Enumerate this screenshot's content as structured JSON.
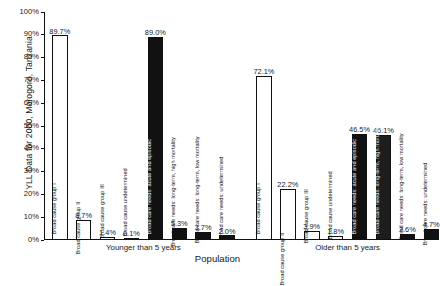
{
  "chart_data": {
    "type": "bar",
    "title": "",
    "ylabel": "YLL Data for 2000, Morogoro, Tanzania",
    "xlabel": "Population",
    "ylim": [
      0,
      100
    ],
    "y_unit": "%",
    "grid": false,
    "legend": "none",
    "y_ticks": [
      "0%",
      "10%",
      "20%",
      "30%",
      "40%",
      "50%",
      "60%",
      "70%",
      "80%",
      "90%",
      "100%"
    ],
    "y_tick_values": [
      0,
      10,
      20,
      30,
      40,
      50,
      60,
      70,
      80,
      90,
      100
    ],
    "groups": [
      {
        "name": "Younger than 5 years",
        "bars": [
          {
            "category": "Broad cause group I",
            "value": 89.7,
            "label": "89.7%",
            "style": "open"
          },
          {
            "category": "Broad cause group II",
            "value": 8.7,
            "label": "8.7%",
            "style": "open"
          },
          {
            "category": "Broad cause group III",
            "value": 1.4,
            "label": "1.4%",
            "style": "open"
          },
          {
            "category": "Broad cause undetermined",
            "value": 0.1,
            "label": "0.1%",
            "style": "open"
          },
          {
            "category": "Broad care needs: acute and episodic",
            "value": 89.0,
            "label": "89.0%",
            "style": "solid"
          },
          {
            "category": "Broad care needs: long-term, high mortality",
            "value": 5.3,
            "label": "5.3%",
            "style": "solid"
          },
          {
            "category": "Broad care needs: long-term, low mortality",
            "value": 3.7,
            "label": "3.7%",
            "style": "solid"
          },
          {
            "category": "Broad care needs: undetermined",
            "value": 2.0,
            "label": "2.0%",
            "style": "solid"
          }
        ]
      },
      {
        "name": "Older than 5 years",
        "bars": [
          {
            "category": "Broad cause group I",
            "value": 72.1,
            "label": "72.1%",
            "style": "open"
          },
          {
            "category": "Broad cause group II",
            "value": 22.2,
            "label": "22.2%",
            "style": "open"
          },
          {
            "category": "Broad cause group III",
            "value": 3.9,
            "label": "3.9%",
            "style": "open"
          },
          {
            "category": "Broad cause undetermined",
            "value": 1.8,
            "label": "1.8%",
            "style": "open"
          },
          {
            "category": "Broad care needs: acute and episodic",
            "value": 46.5,
            "label": "46.5%",
            "style": "solid"
          },
          {
            "category": "Broad care needs: long-term, high mortality",
            "value": 46.1,
            "label": "46.1%",
            "style": "solid"
          },
          {
            "category": "Broad care needs: long-term, low mortality",
            "value": 2.6,
            "label": "2.6%",
            "style": "solid"
          },
          {
            "category": "Broad care needs: undetermined",
            "value": 4.7,
            "label": "4.7%",
            "style": "solid"
          }
        ]
      }
    ],
    "colors": {
      "open_bar_fill": "#ffffff",
      "solid_bar_fill": "#111111",
      "axis": "#111111",
      "text": "#1a1a1a"
    }
  }
}
